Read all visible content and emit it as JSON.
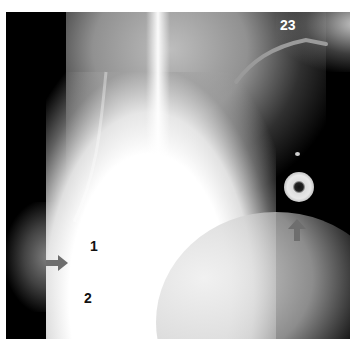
{
  "figure": {
    "panel_number": "23",
    "labels": [
      {
        "id": "1",
        "text": "1"
      },
      {
        "id": "2",
        "text": "2"
      }
    ],
    "arrows": [
      {
        "id": "arrow-right",
        "direction": "right",
        "color": "#6e6e6e"
      },
      {
        "id": "arrow-up",
        "direction": "up",
        "color": "#6e6e6e"
      }
    ],
    "colors": {
      "background": "#000000",
      "tissue_bright": "#ffffff",
      "arrow": "#6e6e6e"
    }
  }
}
